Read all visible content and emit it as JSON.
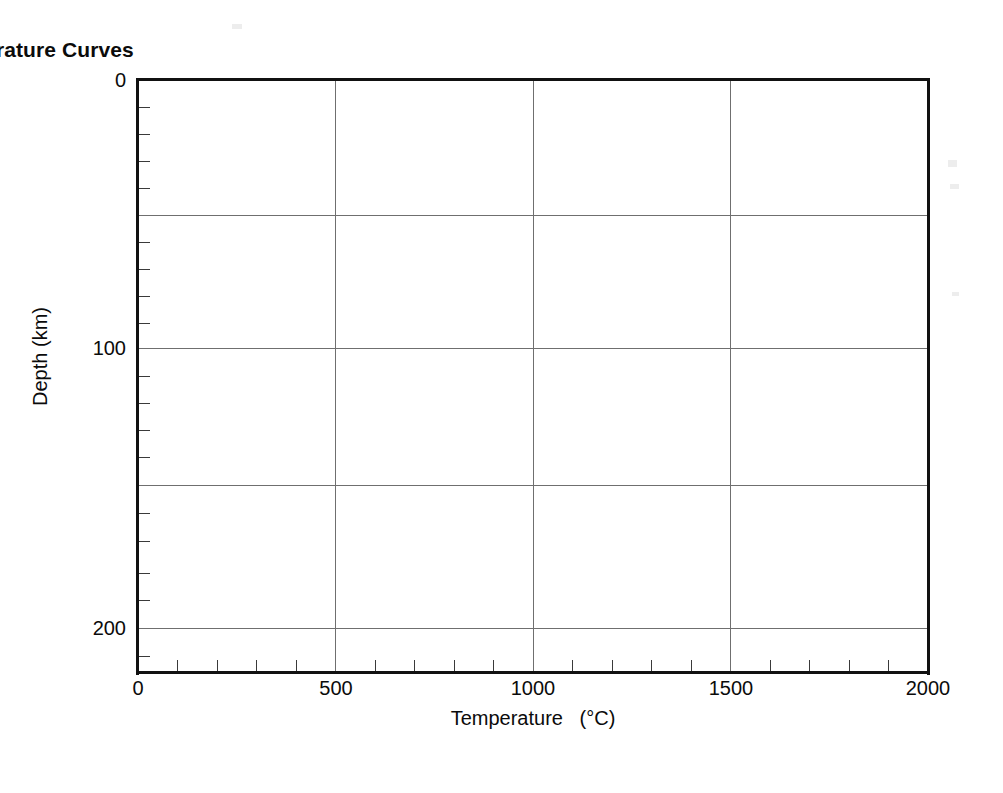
{
  "chart_data": {
    "type": "line",
    "title": "Temperature Curves",
    "xlabel": "Temperature   (°C)",
    "ylabel": "Depth (km)",
    "xlim": [
      0,
      2000
    ],
    "ylim": [
      0,
      210
    ],
    "y_inverted": true,
    "grid": true,
    "legend": null,
    "x_tick_labels": [
      "0",
      "500",
      "1000",
      "1500",
      "2000"
    ],
    "x_tick_values": [
      0,
      500,
      1000,
      1500,
      2000
    ],
    "x_minor_tick_interval": 100,
    "y_tick_labels": [
      "0",
      "100",
      "200"
    ],
    "y_tick_values": [
      0,
      100,
      200
    ],
    "y_minor_tick_interval": 10,
    "x_gridline_values": [
      500,
      1000,
      1500
    ],
    "y_gridline_values": [
      50,
      100,
      150,
      200
    ],
    "series": [],
    "annotations": [],
    "note": "Blank plot template — axes, frame and gridlines only; no data curves are drawn."
  },
  "figure": {
    "background_color": "#ffffff",
    "frame_color": "#111111",
    "gridline_color": "#6f6f6f",
    "text_color": "#0b0b0b"
  }
}
